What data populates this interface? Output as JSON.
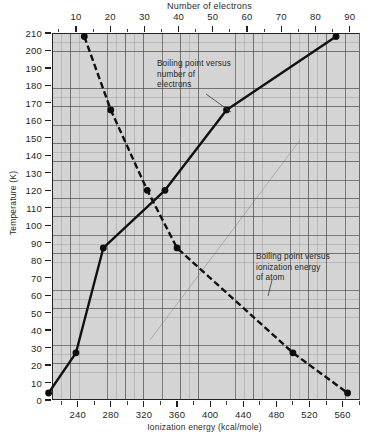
{
  "chart_data": {
    "type": "line",
    "title": "",
    "background_color": "#d4d4d4",
    "grid": true,
    "legend_position": "inline-annotations",
    "axes": {
      "top": {
        "label": "Number of electrons",
        "ticks": [
          10,
          20,
          30,
          40,
          50,
          60,
          70,
          80,
          90
        ],
        "range": [
          3,
          93
        ],
        "minor_tick_step": 5
      },
      "bottom": {
        "label": "Ionization energy (kcal/mole)",
        "ticks": [
          240,
          280,
          320,
          360,
          400,
          440,
          480,
          520,
          560
        ],
        "range": [
          209,
          581
        ],
        "minor_tick_step": 20
      },
      "left": {
        "label": "Temperature (K)",
        "ticks": [
          0,
          10,
          20,
          30,
          40,
          50,
          60,
          70,
          80,
          90,
          100,
          110,
          120,
          130,
          140,
          150,
          160,
          170,
          180,
          190,
          200,
          210
        ],
        "range": [
          0,
          210
        ]
      }
    },
    "series": [
      {
        "name": "Boiling point versus number of electrons",
        "style": "solid",
        "x_axis": "top",
        "xlabel": "Number of electrons",
        "ylabel": "Temperature (K)",
        "points": [
          {
            "x": 2,
            "y": 4
          },
          {
            "x": 10,
            "y": 27
          },
          {
            "x": 18,
            "y": 87
          },
          {
            "x": 36,
            "y": 120
          },
          {
            "x": 54,
            "y": 166
          },
          {
            "x": 86,
            "y": 208
          }
        ]
      },
      {
        "name": "Boiling point versus ionization energy of atom",
        "style": "dashed",
        "x_axis": "bottom",
        "xlabel": "Ionization energy (kcal/mole)",
        "ylabel": "Temperature (K)",
        "points": [
          {
            "x": 248,
            "y": 208
          },
          {
            "x": 280,
            "y": 166
          },
          {
            "x": 324,
            "y": 120
          },
          {
            "x": 360,
            "y": 87
          },
          {
            "x": 500,
            "y": 27
          },
          {
            "x": 566,
            "y": 4
          }
        ]
      }
    ],
    "annotations": [
      {
        "id": "electrons",
        "lines": [
          "Boiling point versus",
          "number of",
          "electrons"
        ],
        "target_series": "Boiling point versus number of electrons"
      },
      {
        "id": "ionization",
        "lines": [
          "Boiling point versus",
          "ionization energy",
          "of atom"
        ],
        "target_series": "Boiling point versus ionization energy of atom"
      }
    ]
  },
  "top_axis": {
    "title": "Number of electrons",
    "labels": [
      "10",
      "20",
      "30",
      "40",
      "50",
      "60",
      "70",
      "80",
      "90"
    ]
  },
  "bottom_axis": {
    "title": "Ionization energy (kcal/mole)",
    "labels": [
      "240",
      "280",
      "320",
      "360",
      "400",
      "440",
      "480",
      "520",
      "560"
    ]
  },
  "left_axis": {
    "title": "Temperature (K)",
    "labels": [
      "210",
      "200",
      "190",
      "180",
      "170",
      "160",
      "150",
      "140",
      "130",
      "120",
      "110",
      "100",
      "90",
      "80",
      "70",
      "60",
      "50",
      "40",
      "30",
      "20",
      "10",
      "0"
    ]
  },
  "annotations": {
    "electrons": {
      "line1": "Boiling point versus",
      "line2": "number of",
      "line3": "electrons"
    },
    "ionization": {
      "line1": "Boiling point versus",
      "line2": "ionization energy",
      "line3": "of atom"
    }
  }
}
